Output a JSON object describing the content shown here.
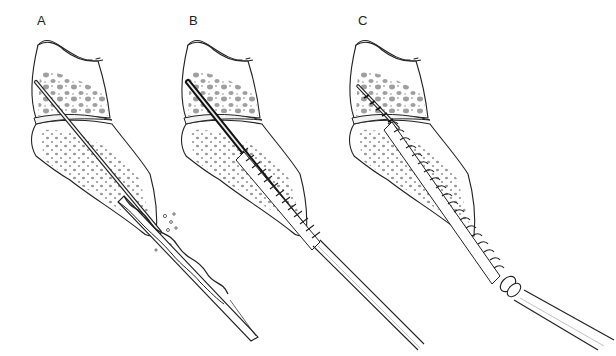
{
  "figure": {
    "panels": [
      {
        "label": "A",
        "stage": "drill over guidewire",
        "tool": "twist-drill"
      },
      {
        "label": "B",
        "stage": "tap over guidewire",
        "tool": "bone-tap"
      },
      {
        "label": "C",
        "stage": "screw inserted with screwdriver",
        "tool": "cannulated-screw"
      }
    ],
    "colors": {
      "line": "#222222",
      "background": "#ffffff",
      "stipple": "#9a9a9a"
    }
  }
}
